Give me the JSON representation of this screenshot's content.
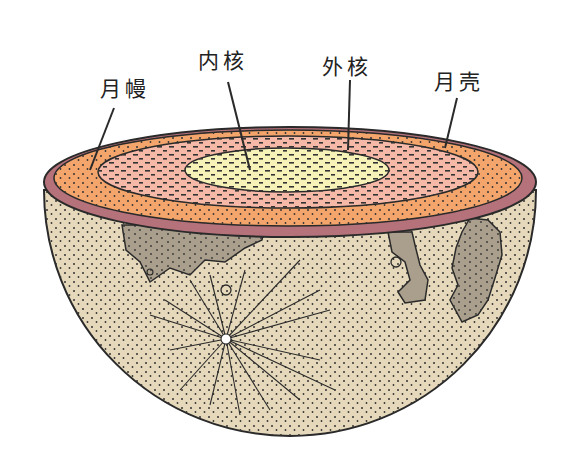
{
  "diagram": {
    "labels": [
      {
        "id": "mantle",
        "text": "月幔",
        "x": 100,
        "y": 72
      },
      {
        "id": "inner_core",
        "text": "内核",
        "x": 198,
        "y": 44
      },
      {
        "id": "outer_core",
        "text": "外核",
        "x": 322,
        "y": 50
      },
      {
        "id": "crust",
        "text": "月壳",
        "x": 434,
        "y": 65
      }
    ],
    "colors": {
      "crust": "#b5727a",
      "mantle": "#f3a56b",
      "outer_core": "#f6b9a8",
      "inner_core": "#f7f3b8",
      "surface": "#e6d9bb",
      "maria": "#a99f8c",
      "outline": "#2a2a2a"
    }
  }
}
